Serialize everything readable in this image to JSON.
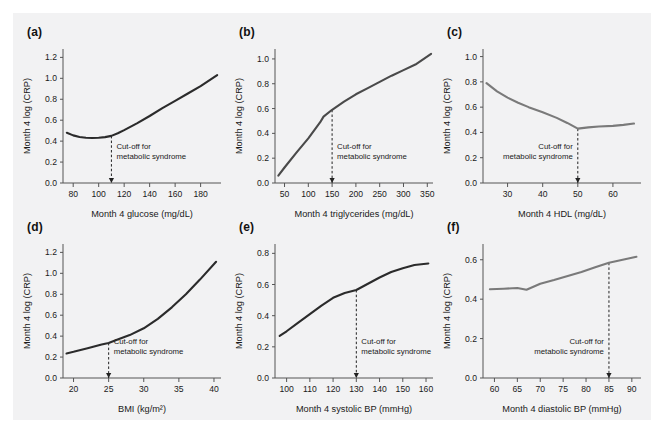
{
  "figure": {
    "background_color": "#f2f2f3",
    "cutoff_note_line1": "Cut-off for",
    "cutoff_note_line2": "metabolic syndrome",
    "shared_ylabel": "Month 4 log (CRP)"
  },
  "chart_data": [
    {
      "type": "line",
      "panel_label": "(a)",
      "title": "",
      "xlabel": "Month 4 glucose (mg/dL)",
      "ylabel": "Month 4 log (CRP)",
      "xlim": [
        72,
        196
      ],
      "ylim": [
        0.0,
        1.28
      ],
      "xticks": [
        80,
        100,
        120,
        140,
        160,
        180
      ],
      "yticks": [
        0.0,
        0.2,
        0.4,
        0.6,
        0.8,
        1.0,
        1.2
      ],
      "ytick_labels": [
        "0.0",
        "0.2",
        "0.4",
        "0.6",
        "0.8",
        "1.0",
        "1.2"
      ],
      "grid": false,
      "legend": "none",
      "line_color": "#2b2b2b",
      "cutoff": 110,
      "cutoff_label": "Cut-off for metabolic syndrome",
      "x": [
        75,
        80,
        85,
        90,
        95,
        100,
        105,
        110,
        115,
        120,
        130,
        140,
        150,
        160,
        170,
        180,
        193
      ],
      "y": [
        0.48,
        0.455,
        0.44,
        0.432,
        0.43,
        0.432,
        0.438,
        0.45,
        0.475,
        0.505,
        0.57,
        0.64,
        0.715,
        0.785,
        0.855,
        0.925,
        1.03
      ]
    },
    {
      "type": "line",
      "panel_label": "(b)",
      "title": "",
      "xlabel": "Month 4 triglycerides (mg/dL)",
      "ylabel": "Month 4 log (CRP)",
      "xlim": [
        30,
        362
      ],
      "ylim": [
        0.0,
        1.08
      ],
      "xticks": [
        50,
        100,
        150,
        200,
        250,
        300,
        350
      ],
      "yticks": [
        0.0,
        0.2,
        0.4,
        0.6,
        0.8,
        1.0
      ],
      "ytick_labels": [
        "0.0",
        "0.2",
        "0.4",
        "0.6",
        "0.8",
        "1.0"
      ],
      "grid": false,
      "legend": "none",
      "line_color": "#4a4a4a",
      "cutoff": 150,
      "cutoff_label": "Cut-off for metabolic syndrome",
      "x": [
        37,
        50,
        75,
        100,
        125,
        132,
        150,
        175,
        200,
        225,
        250,
        275,
        300,
        325,
        358
      ],
      "y": [
        0.06,
        0.125,
        0.245,
        0.36,
        0.49,
        0.535,
        0.59,
        0.655,
        0.715,
        0.765,
        0.815,
        0.865,
        0.91,
        0.955,
        1.04
      ]
    },
    {
      "type": "line",
      "panel_label": "(c)",
      "title": "",
      "xlabel": "Month 4 HDL (mg/dL)",
      "ylabel": "Month 4 log (CRP)",
      "xlim": [
        23,
        68
      ],
      "ylim": [
        0.0,
        1.06
      ],
      "xticks": [
        30,
        40,
        50,
        60
      ],
      "yticks": [
        0.0,
        0.2,
        0.4,
        0.6,
        0.8,
        1.0
      ],
      "ytick_labels": [
        "0.0",
        "0.2",
        "0.4",
        "0.6",
        "0.8",
        "1.0"
      ],
      "grid": false,
      "legend": "none",
      "line_color": "#7a7a7a",
      "cutoff": 50,
      "cutoff_label": "Cut-off for metabolic syndrome",
      "x": [
        24,
        27,
        30,
        33,
        36,
        40,
        44,
        47,
        50,
        53,
        56,
        60,
        63,
        66
      ],
      "y": [
        0.79,
        0.725,
        0.675,
        0.635,
        0.6,
        0.56,
        0.515,
        0.475,
        0.43,
        0.44,
        0.447,
        0.452,
        0.46,
        0.47
      ]
    },
    {
      "type": "line",
      "panel_label": "(d)",
      "title": "",
      "xlabel": "BMI (kg/m²)",
      "ylabel": "Month 4 log (CRP)",
      "xlim": [
        18.5,
        41
      ],
      "ylim": [
        0.0,
        1.28
      ],
      "xticks": [
        20,
        25,
        30,
        35,
        40
      ],
      "yticks": [
        0.0,
        0.2,
        0.4,
        0.6,
        0.8,
        1.0,
        1.2
      ],
      "ytick_labels": [
        "0.0",
        "0.2",
        "0.4",
        "0.6",
        "0.8",
        "1.0",
        "1.2"
      ],
      "grid": false,
      "legend": "none",
      "line_color": "#2b2b2b",
      "cutoff": 25,
      "cutoff_label": "Cut-off for metabolic syndrome",
      "x": [
        19,
        20,
        22,
        24,
        25,
        26,
        28,
        30,
        32,
        34,
        36,
        38,
        40.3
      ],
      "y": [
        0.235,
        0.25,
        0.285,
        0.32,
        0.335,
        0.36,
        0.41,
        0.475,
        0.565,
        0.675,
        0.8,
        0.94,
        1.11
      ]
    },
    {
      "type": "line",
      "panel_label": "(e)",
      "title": "",
      "xlabel": "Month 4 systolic BP (mmHg)",
      "ylabel": "Month 4 log (CRP)",
      "xlim": [
        95,
        163
      ],
      "ylim": [
        0.0,
        0.86
      ],
      "xticks": [
        100,
        110,
        120,
        130,
        140,
        150,
        160
      ],
      "yticks": [
        0.0,
        0.2,
        0.4,
        0.6,
        0.8
      ],
      "ytick_labels": [
        "0.0",
        "0.2",
        "0.4",
        "0.6",
        "0.8"
      ],
      "grid": false,
      "legend": "none",
      "line_color": "#2b2b2b",
      "cutoff": 130,
      "cutoff_label": "Cut-off for metabolic syndrome",
      "x": [
        97,
        100,
        105,
        110,
        115,
        120,
        125,
        130,
        135,
        140,
        145,
        150,
        155,
        161
      ],
      "y": [
        0.27,
        0.3,
        0.355,
        0.41,
        0.465,
        0.515,
        0.545,
        0.565,
        0.605,
        0.645,
        0.68,
        0.705,
        0.725,
        0.735
      ]
    },
    {
      "type": "line",
      "panel_label": "(f)",
      "title": "",
      "xlabel": "Month 4 diastolic BP (mmHg)",
      "ylabel": "Month 4 log (CRP)",
      "xlim": [
        57.5,
        92
      ],
      "ylim": [
        0.0,
        0.68
      ],
      "xticks": [
        60,
        65,
        70,
        75,
        80,
        85,
        90
      ],
      "yticks": [
        0.0,
        0.2,
        0.4,
        0.6
      ],
      "ytick_labels": [
        "0.0",
        "0.2",
        "0.4",
        "0.6"
      ],
      "grid": false,
      "legend": "none",
      "line_color": "#7a7a7a",
      "cutoff": 85,
      "cutoff_label": "Cut-off for metabolic syndrome",
      "x": [
        59,
        62,
        65,
        67,
        70,
        73,
        76,
        79,
        82,
        85,
        88,
        91
      ],
      "y": [
        0.45,
        0.453,
        0.457,
        0.448,
        0.478,
        0.497,
        0.518,
        0.538,
        0.562,
        0.585,
        0.6,
        0.615
      ]
    }
  ]
}
